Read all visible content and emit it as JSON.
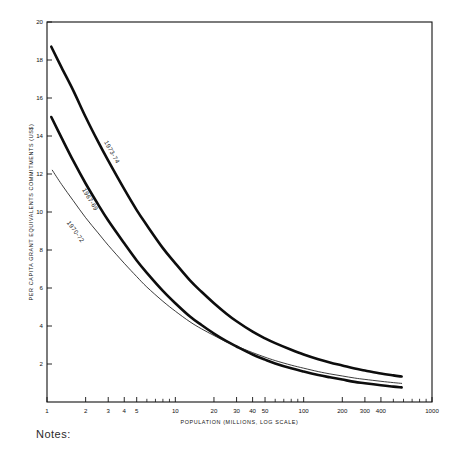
{
  "chart_data": {
    "type": "line",
    "title": "",
    "xlabel": "POPULATION (MILLIONS, LOG SCALE)",
    "ylabel": "PER CAPITA GRANT EQUIVALENTS COMMITMENTS (US$)",
    "xscale": "log",
    "yscale": "linear",
    "xlim": [
      1,
      1000
    ],
    "ylim": [
      0,
      20
    ],
    "grid": false,
    "legend_position": "inline-curve-labels",
    "xticks": [
      1,
      2,
      3,
      4,
      5,
      10,
      20,
      30,
      40,
      50,
      100,
      200,
      300,
      400,
      1000
    ],
    "xtick_labels": [
      "1",
      "2",
      "3",
      "4",
      "5",
      "10",
      "20",
      "30",
      "40",
      "50",
      "100",
      "200",
      "300",
      "400",
      "1000"
    ],
    "xminor_ticks": [
      6,
      7,
      8,
      9,
      60,
      70,
      80,
      90,
      500,
      600,
      700,
      800,
      900
    ],
    "yticks": [
      2,
      4,
      6,
      8,
      10,
      12,
      14,
      16,
      18,
      20
    ],
    "ytick_labels": [
      "2",
      "4",
      "6",
      "8",
      "10",
      "12",
      "14",
      "16",
      "18",
      "20"
    ],
    "series": [
      {
        "name": "1973-74",
        "label": "1973-74",
        "style": "thick",
        "linewidth": 2.6,
        "color": "#0d0d0d",
        "label_x": 3.1,
        "label_y": 13.1,
        "x": [
          1.08,
          1.3,
          1.6,
          2,
          2.5,
          3,
          4,
          5,
          6,
          8,
          10,
          13,
          16,
          20,
          25,
          30,
          40,
          50,
          60,
          80,
          100,
          130,
          160,
          200,
          250,
          300,
          400,
          500,
          580
        ],
        "y": [
          18.7,
          17.6,
          16.4,
          15.0,
          13.7,
          12.7,
          11.2,
          10.1,
          9.3,
          8.1,
          7.3,
          6.4,
          5.8,
          5.2,
          4.65,
          4.25,
          3.7,
          3.35,
          3.1,
          2.75,
          2.5,
          2.25,
          2.08,
          1.92,
          1.76,
          1.66,
          1.5,
          1.4,
          1.34
        ]
      },
      {
        "name": "1967-69",
        "label": "1967-69",
        "style": "thick",
        "linewidth": 2.6,
        "color": "#0d0d0d",
        "label_x": 2.1,
        "label_y": 10.6,
        "x": [
          1.08,
          1.3,
          1.6,
          2,
          2.5,
          3,
          4,
          5,
          6,
          8,
          10,
          13,
          16,
          20,
          25,
          30,
          40,
          50,
          60,
          80,
          100,
          130,
          160,
          200,
          250,
          300,
          400,
          500,
          580
        ],
        "y": [
          15.0,
          13.9,
          12.7,
          11.5,
          10.4,
          9.55,
          8.35,
          7.45,
          6.8,
          5.85,
          5.2,
          4.5,
          4.05,
          3.6,
          3.2,
          2.92,
          2.5,
          2.23,
          2.03,
          1.77,
          1.6,
          1.42,
          1.3,
          1.18,
          1.06,
          0.99,
          0.88,
          0.81,
          0.77
        ]
      },
      {
        "name": "1970-72",
        "label": "1970-72",
        "style": "thin",
        "linewidth": 0.85,
        "color": "#1a1a1a",
        "label_x": 1.62,
        "label_y": 8.9,
        "x": [
          1.1,
          1.3,
          1.6,
          2,
          2.5,
          3,
          4,
          5,
          6,
          8,
          10,
          13,
          16,
          20,
          25,
          30,
          40,
          50,
          60,
          80,
          100,
          130,
          160,
          200,
          250,
          300,
          400,
          500,
          580
        ],
        "y": [
          12.2,
          11.45,
          10.6,
          9.7,
          8.9,
          8.25,
          7.3,
          6.6,
          6.05,
          5.3,
          4.78,
          4.22,
          3.85,
          3.5,
          3.17,
          2.94,
          2.6,
          2.36,
          2.18,
          1.94,
          1.78,
          1.6,
          1.48,
          1.37,
          1.26,
          1.19,
          1.09,
          1.02,
          0.98
        ]
      }
    ]
  },
  "footer": {
    "notes_label": "Notes:"
  }
}
